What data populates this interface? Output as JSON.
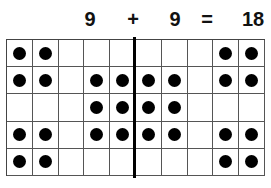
{
  "equation": {
    "tokens": [
      {
        "text": "9",
        "x": 90
      },
      {
        "text": "+",
        "x": 133
      },
      {
        "text": "9",
        "x": 175
      },
      {
        "text": "=",
        "x": 207
      },
      {
        "text": "18",
        "x": 253
      }
    ]
  },
  "grid": {
    "rows": 5,
    "columns": 10,
    "divider_after_column": 5,
    "dots": [
      [
        1,
        1,
        0,
        0,
        0,
        0,
        0,
        0,
        1,
        1
      ],
      [
        1,
        1,
        0,
        1,
        1,
        1,
        1,
        0,
        1,
        1
      ],
      [
        0,
        0,
        0,
        1,
        1,
        1,
        1,
        0,
        0,
        0
      ],
      [
        1,
        1,
        0,
        1,
        1,
        1,
        1,
        0,
        1,
        1
      ],
      [
        1,
        1,
        0,
        0,
        0,
        0,
        0,
        0,
        1,
        1
      ]
    ]
  },
  "colors": {
    "dot": "#000000",
    "grid_line": "#555555",
    "background": "#ffffff"
  }
}
